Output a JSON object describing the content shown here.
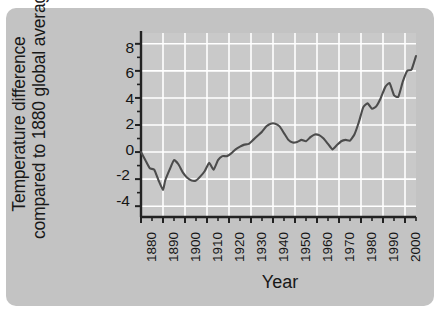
{
  "figure": {
    "background_color": "#c3c3c3",
    "plot_background_color": "#c9c9c9",
    "gridline_color": "#ffffff",
    "axis_color": "#222222",
    "line_color": "#4c4c4c"
  },
  "chart_data": {
    "type": "line",
    "title": "",
    "xlabel": "Year",
    "ylabel_line1": "Temperature difference",
    "ylabel_line2": "compared to 1880",
    "ylabel_line3": "global average (°C)",
    "ylabel": "Temperature difference compared to 1880 global average (°C)",
    "xlim": [
      1880,
      2005
    ],
    "ylim": [
      -4.8,
      8.8
    ],
    "yticks": [
      8,
      6,
      4,
      2,
      0,
      -2,
      -4
    ],
    "ytick_labels": [
      "8",
      "6",
      "4",
      "2",
      "0",
      "-2",
      "-4"
    ],
    "ytick_minor_step": 1,
    "xticks": [
      1880,
      1890,
      1900,
      1910,
      1920,
      1930,
      1940,
      1950,
      1960,
      1970,
      1980,
      1990,
      2000
    ],
    "xtick_labels": [
      "1880",
      "1890",
      "1900",
      "1910",
      "1920",
      "1930",
      "1940",
      "1950",
      "1960",
      "1970",
      "1980",
      "1990",
      "2000"
    ],
    "xtick_minor_step": 5,
    "grid": true,
    "legend": false,
    "x": [
      1880,
      1882,
      1884,
      1886,
      1888,
      1890,
      1891,
      1893,
      1895,
      1897,
      1899,
      1901,
      1903,
      1905,
      1907,
      1909,
      1911,
      1913,
      1915,
      1917,
      1919,
      1921,
      1923,
      1925,
      1927,
      1929,
      1931,
      1933,
      1935,
      1937,
      1939,
      1941,
      1943,
      1945,
      1947,
      1949,
      1951,
      1953,
      1955,
      1957,
      1959,
      1961,
      1963,
      1965,
      1967,
      1969,
      1971,
      1973,
      1975,
      1977,
      1979,
      1981,
      1983,
      1985,
      1987,
      1989,
      1991,
      1993,
      1995,
      1997,
      1999,
      2001,
      2003,
      2005
    ],
    "y": [
      0.0,
      -0.6,
      -1.2,
      -1.3,
      -2.1,
      -2.8,
      -2.1,
      -1.3,
      -0.6,
      -0.9,
      -1.5,
      -1.9,
      -2.1,
      -2.1,
      -1.8,
      -1.4,
      -0.8,
      -1.3,
      -0.6,
      -0.3,
      -0.3,
      -0.1,
      0.2,
      0.4,
      0.55,
      0.6,
      0.9,
      1.2,
      1.5,
      1.9,
      2.1,
      2.1,
      1.9,
      1.4,
      0.9,
      0.7,
      0.75,
      0.9,
      0.8,
      1.1,
      1.3,
      1.25,
      1.0,
      0.6,
      0.2,
      0.5,
      0.8,
      0.9,
      0.85,
      1.3,
      2.2,
      3.3,
      3.6,
      3.2,
      3.4,
      4.0,
      4.8,
      5.1,
      4.2,
      4.1,
      5.2,
      6.0,
      6.1,
      7.1
    ]
  }
}
